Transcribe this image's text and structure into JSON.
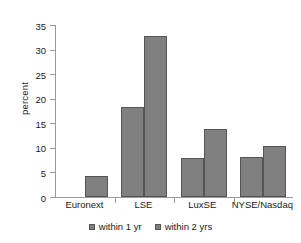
{
  "chart_data": {
    "type": "bar",
    "title": "",
    "xlabel": "",
    "ylabel": "percent",
    "categories": [
      "Euronext",
      "LSE",
      "LuxSE",
      "NYSE/Nasdaq"
    ],
    "series": [
      {
        "name": "within 1 yr",
        "values": [
          0,
          18.4,
          8.0,
          8.1
        ]
      },
      {
        "name": "within 2 yrs",
        "values": [
          4.2,
          32.7,
          13.9,
          10.3
        ]
      }
    ],
    "ylim": [
      0,
      35
    ],
    "yticks": [
      0,
      5,
      10,
      15,
      20,
      25,
      30,
      35
    ],
    "ytick_labels": [
      "0",
      "5",
      "10",
      "15",
      "20",
      "25",
      "30",
      "35"
    ],
    "grid": false,
    "legend_position": "bottom",
    "bar_color": "#808080",
    "bar_border_color": "#555555",
    "axis_color": "#9a9a9a",
    "text_color": "#1a1a1a",
    "background": "#ffffff"
  }
}
